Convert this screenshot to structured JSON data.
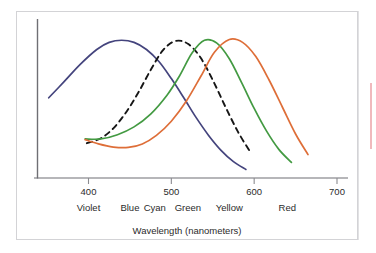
{
  "figure": {
    "background_color": "#ffffff",
    "frame_color": "#d3d3d6"
  },
  "axis": {
    "x_title": "Wavelength (nanometers)",
    "tick_numbers": [
      "400",
      "500",
      "600",
      "700"
    ],
    "color_names": [
      "Violet",
      "Blue",
      "Cyan",
      "Green",
      "Yellow",
      "Red"
    ],
    "axis_line_color": "#6f6f74"
  },
  "chart_data": {
    "type": "line",
    "title": "",
    "subtitle": "",
    "xlabel": "Wavelength (nanometers)",
    "ylabel": "",
    "xlim": [
      350,
      710
    ],
    "ylim": [
      0,
      1
    ],
    "grid": false,
    "legend": "none",
    "xticks": [
      400,
      500,
      600,
      700
    ],
    "xtick_labels": [
      "400",
      "500",
      "600",
      "700"
    ],
    "x_band_labels": [
      {
        "label": "Violet",
        "wavelength": 400
      },
      {
        "label": "Blue",
        "wavelength": 450
      },
      {
        "label": "Cyan",
        "wavelength": 480
      },
      {
        "label": "Green",
        "wavelength": 520
      },
      {
        "label": "Yellow",
        "wavelength": 570
      },
      {
        "label": "Red",
        "wavelength": 640
      }
    ],
    "series": [
      {
        "name": "blue-cone-response",
        "color": "#44447d",
        "style": "solid",
        "peak_wavelength": 440,
        "x": [
          352,
          370,
          390,
          410,
          425,
          440,
          455,
          470,
          485,
          500,
          515,
          530,
          545,
          560,
          575,
          590
        ],
        "y": [
          0.565,
          0.675,
          0.8,
          0.905,
          0.955,
          0.97,
          0.955,
          0.905,
          0.82,
          0.7,
          0.565,
          0.425,
          0.3,
          0.195,
          0.115,
          0.06
        ]
      },
      {
        "name": "rod-response-dashed",
        "color": "#161616",
        "style": "dashed",
        "peak_wavelength": 505,
        "x": [
          398,
          415,
          430,
          445,
          460,
          475,
          490,
          505,
          520,
          535,
          550,
          565,
          580,
          595
        ],
        "y": [
          0.245,
          0.28,
          0.35,
          0.46,
          0.6,
          0.76,
          0.9,
          0.965,
          0.945,
          0.85,
          0.69,
          0.505,
          0.33,
          0.185
        ]
      },
      {
        "name": "green-cone-response",
        "color": "#439a42",
        "style": "solid",
        "peak_wavelength": 540,
        "x": [
          396,
          415,
          435,
          455,
          475,
          495,
          510,
          525,
          540,
          555,
          570,
          585,
          600,
          615,
          630,
          645
        ],
        "y": [
          0.275,
          0.275,
          0.305,
          0.36,
          0.45,
          0.585,
          0.72,
          0.88,
          0.97,
          0.95,
          0.84,
          0.67,
          0.49,
          0.33,
          0.2,
          0.11
        ]
      },
      {
        "name": "red-cone-response",
        "color": "#de6e38",
        "style": "solid",
        "peak_wavelength": 570,
        "x": [
          396,
          412,
          430,
          448,
          465,
          482,
          500,
          518,
          536,
          552,
          570,
          586,
          602,
          618,
          634,
          650,
          665
        ],
        "y": [
          0.27,
          0.24,
          0.218,
          0.215,
          0.24,
          0.3,
          0.4,
          0.54,
          0.72,
          0.885,
          0.975,
          0.955,
          0.855,
          0.69,
          0.5,
          0.31,
          0.165
        ]
      }
    ]
  }
}
